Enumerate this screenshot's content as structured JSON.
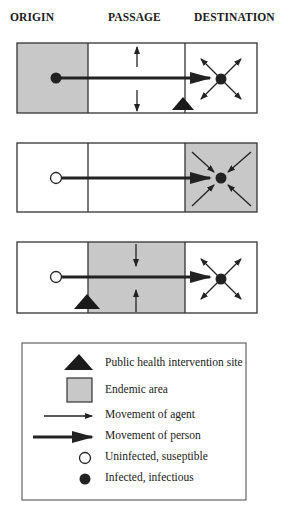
{
  "headers": {
    "origin": "ORIGIN",
    "passage": "PASSAGE",
    "destination": "DESTINATION"
  },
  "colors": {
    "endemic_fill": "#c8c8c8",
    "line": "#222222",
    "background": "#ffffff"
  },
  "scenarios": [
    {
      "id": 1,
      "endemic_zone": "origin",
      "traveler_state": "infected",
      "passage_agent_direction": "outward",
      "destination_agent_direction": "outward",
      "intervention_site": "destination-entry"
    },
    {
      "id": 2,
      "endemic_zone": "destination",
      "traveler_state": "uninfected",
      "destination_agent_direction": "inward",
      "arrival_state": "infected",
      "intervention_site": "none"
    },
    {
      "id": 3,
      "endemic_zone": "passage",
      "traveler_state": "uninfected",
      "passage_agent_direction": "inward",
      "destination_agent_direction": "outward",
      "arrival_state": "infected",
      "intervention_site": "passage-entry"
    }
  ],
  "legend": {
    "items": [
      {
        "icon": "triangle-icon",
        "label": "Public health intervention site"
      },
      {
        "icon": "gray-square-icon",
        "label": "Endemic area"
      },
      {
        "icon": "thin-arrow-icon",
        "label": "Movement of agent"
      },
      {
        "icon": "thick-arrow-icon",
        "label": "Movement of person"
      },
      {
        "icon": "open-circle-icon",
        "label": "Uninfected, suseptible"
      },
      {
        "icon": "filled-circle-icon",
        "label": "Infected, infectious"
      }
    ]
  }
}
